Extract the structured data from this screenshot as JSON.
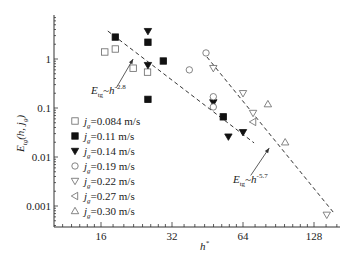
{
  "chart_data": {
    "type": "scatter",
    "title": "",
    "xlabel": "h*",
    "ylabel": "E_tg(h, j_g)",
    "xscale": "log2",
    "yscale": "log10",
    "xlim": [
      10.1,
      165
    ],
    "ylim": [
      0.00037,
      7.9
    ],
    "xticks": [
      16,
      32,
      64,
      128
    ],
    "xtick_labels": [
      "16",
      "32",
      "64",
      "128"
    ],
    "yticks": [
      1,
      0.1,
      0.01,
      0.001
    ],
    "ytick_labels": [
      "1",
      "0.1",
      "0.01",
      "0.001"
    ],
    "grid": false,
    "legend_position": "bottom-left",
    "series": [
      {
        "name": "j_g=0.084 m/s",
        "jg": "0.084",
        "marker": "square-open",
        "points": [
          [
            16.6,
            1.39
          ],
          [
            18.4,
            1.6
          ],
          [
            21.9,
            0.65
          ],
          [
            25.2,
            0.54
          ]
        ]
      },
      {
        "name": "j_g=0.11 m/s",
        "jg": "0.11",
        "marker": "square-filled",
        "points": [
          [
            18.4,
            2.8
          ],
          [
            25.3,
            2.2
          ],
          [
            29.4,
            0.91
          ],
          [
            25.3,
            0.15
          ],
          [
            52.8,
            0.066
          ]
        ]
      },
      {
        "name": "j_g=0.14 m/s",
        "jg": "0.14",
        "marker": "triangle-down-filled",
        "points": [
          [
            25.3,
            3.7
          ],
          [
            25.3,
            0.75
          ],
          [
            47.9,
            0.13
          ],
          [
            64,
            0.032
          ],
          [
            55.5,
            0.026
          ]
        ]
      },
      {
        "name": "j_g=0.19 m/s",
        "jg": "0.19",
        "marker": "circle-open",
        "points": [
          [
            37.9,
            0.6
          ],
          [
            44.6,
            1.33
          ],
          [
            47.9,
            0.17
          ],
          [
            47.9,
            0.105
          ]
        ]
      },
      {
        "name": "j_g=0.22 m/s",
        "jg": "0.22",
        "marker": "triangle-down-open",
        "points": [
          [
            47.9,
            0.65
          ],
          [
            64,
            0.2
          ],
          [
            70.6,
            0.079
          ],
          [
            145,
            0.00066
          ]
        ]
      },
      {
        "name": "j_g=0.27 m/s",
        "jg": "0.27",
        "marker": "triangle-left-open",
        "points": [
          [
            70.6,
            0.052
          ]
        ]
      },
      {
        "name": "j_g=0.30 m/s",
        "jg": "0.30",
        "marker": "triangle-up-open",
        "points": [
          [
            81.6,
            0.12
          ],
          [
            96.6,
            0.02
          ]
        ]
      }
    ],
    "fit_lines": [
      {
        "label": "E_tg~h^-2.8",
        "exponent": "-2.8",
        "from": [
          17.1,
          3.72
        ],
        "to": [
          71.3,
          0.0194
        ]
      },
      {
        "label": "E_tg~h^-5.7",
        "exponent": "-5.7",
        "from": [
          45,
          1.1
        ],
        "to": [
          157,
          0.00068
        ]
      }
    ],
    "annotations": [
      {
        "text_main": "E",
        "text_sub": "tg",
        "text_mid": "~h",
        "text_sup": "-2.8",
        "text_at": [
          14.5,
          0.19
        ],
        "arrow_from": [
          18.6,
          0.26
        ],
        "arrow_to": [
          21.9,
          1.0
        ]
      },
      {
        "text_main": "E",
        "text_sub": "tg",
        "text_mid": "~h",
        "text_sup": "-5.7",
        "text_at": [
          58,
          0.0029
        ],
        "arrow_from": [
          69,
          0.0042
        ],
        "arrow_to": [
          82.7,
          0.0153
        ]
      }
    ]
  },
  "legend": {
    "unit": "m/s",
    "prefix": "j",
    "sub": "g"
  },
  "axes": {
    "x_title_main": "h",
    "x_title_sup": "*",
    "y_title_main": "E",
    "y_title_sub": "tg",
    "y_title_rest": "(h, j",
    "y_title_sub2": "g",
    "y_title_close": ")"
  }
}
